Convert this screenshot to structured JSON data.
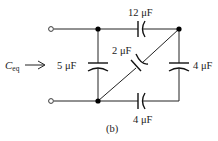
{
  "figure": {
    "label": "(b)",
    "equivalent_label": "C",
    "equivalent_subscript": "eq"
  },
  "capacitors": {
    "top": {
      "value": "12 μF"
    },
    "left": {
      "value": "5 μF"
    },
    "diagonal": {
      "value": "2 μF"
    },
    "right": {
      "value": "4 μF"
    },
    "bottom": {
      "value": "4 μF"
    }
  },
  "colors": {
    "wire": "#222222",
    "node": "#000000",
    "background": "#ffffff"
  }
}
